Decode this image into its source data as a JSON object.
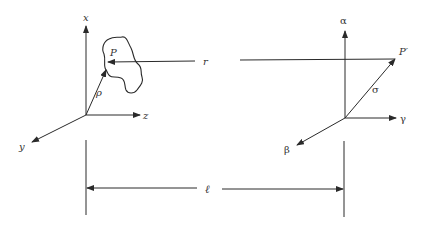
{
  "diagram": {
    "type": "coordinate-geometry",
    "colors": {
      "line": "#2a2a2a",
      "text": "#333333",
      "background": "#ffffff"
    }
  },
  "left_frame": {
    "axis_x_label": "x",
    "axis_y_label": "y",
    "axis_z_label": "z",
    "point_label": "P",
    "vector_label": "ρ"
  },
  "right_frame": {
    "axis_alpha_label": "α",
    "axis_beta_label": "β",
    "axis_gamma_label": "γ",
    "point_label": "P′",
    "vector_label": "σ"
  },
  "connections": {
    "distance_label": "r",
    "separation_label": "ℓ"
  }
}
